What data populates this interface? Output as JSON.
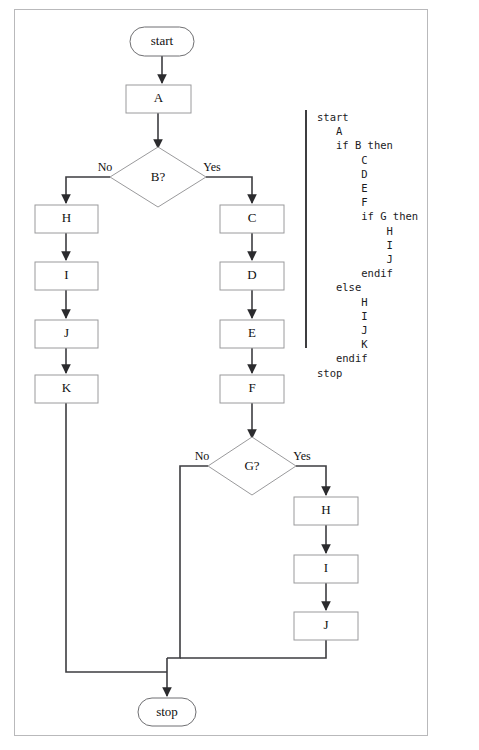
{
  "diagram": {
    "colors": {
      "node_stroke": "#9a9a9c",
      "terminal_stroke": "#6f6f72",
      "edge": "#3d3d40",
      "text": "#111111",
      "page_border": "#b9b9bb",
      "background": "#ffffff"
    },
    "nodes": {
      "start": "start",
      "a": "A",
      "b_decision": "B?",
      "h_left": "H",
      "i_left": "I",
      "j_left": "J",
      "k_left": "K",
      "c": "C",
      "d": "D",
      "e": "E",
      "f": "F",
      "g_decision": "G?",
      "h_lower": "H",
      "i_lower": "I",
      "j_lower": "J",
      "stop": "stop"
    },
    "edge_labels": {
      "b_no": "No",
      "b_yes": "Yes",
      "g_no": "No",
      "g_yes": "Yes"
    }
  },
  "pseudocode": {
    "lines": [
      "start",
      "   A",
      "   if B then",
      "       C",
      "       D",
      "       E",
      "       F",
      "       if G then",
      "           H",
      "           I",
      "           J",
      "       endif",
      "   else",
      "       H",
      "       I",
      "       J",
      "       K",
      "   endif",
      "stop"
    ],
    "text": "start\n   A\n   if B then\n       C\n       D\n       E\n       F\n       if G then\n           H\n           I\n           J\n       endif\n   else\n       H\n       I\n       J\n       K\n   endif\nstop"
  }
}
